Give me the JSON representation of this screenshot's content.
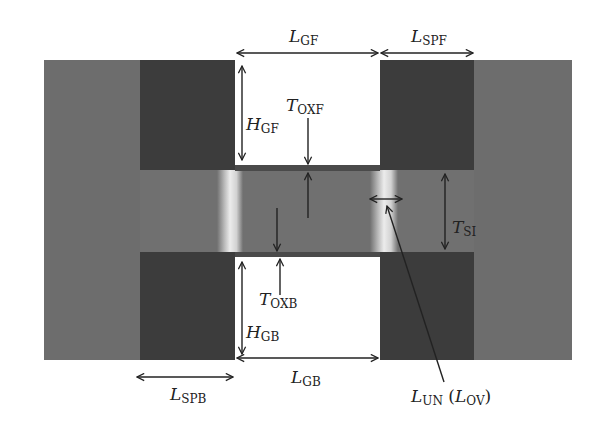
{
  "colors": {
    "background": "#ffffff",
    "source_drain": "#6d6d6d",
    "spacer": "#3c3c3c",
    "gate": "#ffffff",
    "oxide": "#4a4a4a",
    "silicon": "#707070",
    "junction_highlight": "#e6e6e6",
    "annotation": "#222222"
  },
  "labels": {
    "l_gf": {
      "main": "L",
      "sub": "GF"
    },
    "l_spf": {
      "main": "L",
      "sub": "SPF"
    },
    "h_gf": {
      "main": "H",
      "sub": "GF"
    },
    "t_oxf": {
      "main": "T",
      "sub": "OXF"
    },
    "t_si": {
      "main": "T",
      "sub": "SI"
    },
    "t_oxb": {
      "main": "T",
      "sub": "OXB"
    },
    "h_gb": {
      "main": "H",
      "sub": "GB"
    },
    "l_spb": {
      "main": "L",
      "sub": "SPB"
    },
    "l_gb": {
      "main": "L",
      "sub": "GB"
    },
    "l_un": {
      "main": "L",
      "sub": "UN",
      "paren_main": "L",
      "paren_sub": "OV",
      "open": " (",
      "close": ")"
    }
  },
  "regions": [
    {
      "name": "source-drain-body",
      "x": 44,
      "y": 60,
      "w": 528,
      "h": 300
    },
    {
      "name": "front-left-spacer",
      "x": 140,
      "y": 60,
      "w": 95,
      "h": 110
    },
    {
      "name": "front-right-spacer",
      "x": 380,
      "y": 60,
      "w": 94,
      "h": 110
    },
    {
      "name": "front-gate",
      "x": 235,
      "y": 60,
      "w": 145,
      "h": 105
    },
    {
      "name": "back-left-spacer",
      "x": 140,
      "y": 252,
      "w": 95,
      "h": 108
    },
    {
      "name": "back-right-spacer",
      "x": 380,
      "y": 252,
      "w": 94,
      "h": 108
    },
    {
      "name": "back-gate",
      "x": 235,
      "y": 257,
      "w": 145,
      "h": 103
    }
  ]
}
